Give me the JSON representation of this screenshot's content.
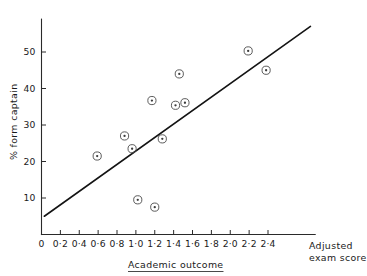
{
  "chart_data": {
    "type": "scatter",
    "title": "",
    "xlabel": "Academic outcome",
    "xlabel_secondary_line1": "Adjusted",
    "xlabel_secondary_line2": "exam score",
    "ylabel": "% form captain",
    "xlim": [
      0,
      2.9
    ],
    "ylim": [
      0,
      59
    ],
    "grid": false,
    "legend": null,
    "x_tick_labels": [
      "0",
      "0·2",
      "0·4",
      "0·6",
      "0·8",
      "1·0",
      "1·2",
      "1·4",
      "1·6",
      "1·8",
      "2·0",
      "2·2",
      "2·4"
    ],
    "x_tick_values": [
      0,
      0.2,
      0.4,
      0.6,
      0.8,
      1.0,
      1.2,
      1.4,
      1.6,
      1.8,
      2.0,
      2.2,
      2.4
    ],
    "y_tick_labels": [
      "10",
      "20",
      "30",
      "40",
      "50"
    ],
    "y_tick_values": [
      10,
      20,
      30,
      40,
      50
    ],
    "points": [
      {
        "x": 0.59,
        "y": 21.5
      },
      {
        "x": 0.88,
        "y": 27.0
      },
      {
        "x": 0.96,
        "y": 23.5
      },
      {
        "x": 1.02,
        "y": 9.5
      },
      {
        "x": 1.17,
        "y": 36.7
      },
      {
        "x": 1.2,
        "y": 7.5
      },
      {
        "x": 1.28,
        "y": 26.2
      },
      {
        "x": 1.42,
        "y": 35.4
      },
      {
        "x": 1.46,
        "y": 44.0
      },
      {
        "x": 1.52,
        "y": 36.1
      },
      {
        "x": 2.19,
        "y": 50.3
      },
      {
        "x": 2.38,
        "y": 45.0
      }
    ],
    "fit_line": {
      "type": "linear",
      "x_start": 0.03,
      "y_start": 5.0,
      "x_end": 2.85,
      "y_end": 57.0
    },
    "colors": {
      "axis": "#2a2a2a",
      "line": "#141414",
      "marker": "#4a4a4a",
      "background": "#ffffff"
    }
  }
}
